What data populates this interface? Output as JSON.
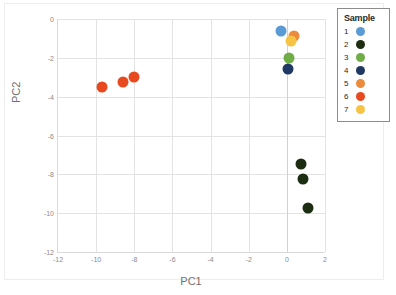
{
  "chart_data": {
    "type": "scatter",
    "title": "",
    "xlabel": "PC1",
    "ylabel": "PC2",
    "xlim": [
      -12,
      2
    ],
    "ylim": [
      -12,
      0
    ],
    "xticks": [
      "-12",
      "-10",
      "-8",
      "-6",
      "-4",
      "-2",
      "0",
      "2"
    ],
    "xtick_values": [
      -12,
      -10,
      -8,
      -6,
      -4,
      -2,
      0,
      2
    ],
    "yticks": [
      "0",
      "-2",
      "-4",
      "-6",
      "-8",
      "-10",
      "-12"
    ],
    "ytick_values": [
      0,
      -2,
      -4,
      -6,
      -8,
      -10,
      -12
    ],
    "grid": true,
    "legend_position": "right",
    "legend_title": "Sample",
    "series": [
      {
        "name": "1",
        "color": "#5b9bd5",
        "points": [
          [
            -0.3,
            -0.6
          ]
        ]
      },
      {
        "name": "2",
        "color": "#1d2d12",
        "points": [
          [
            0.75,
            -7.45
          ],
          [
            0.85,
            -8.25
          ],
          [
            1.1,
            -9.75
          ]
        ]
      },
      {
        "name": "3",
        "color": "#70ad47",
        "points": [
          [
            0.1,
            -2.0
          ]
        ]
      },
      {
        "name": "4",
        "color": "#1f3864",
        "points": [
          [
            0.05,
            -2.6
          ]
        ]
      },
      {
        "name": "5",
        "color": "#ed8b3c",
        "points": [
          [
            0.35,
            -0.85
          ]
        ]
      },
      {
        "name": "6",
        "color": "#e8491f",
        "points": [
          [
            -9.7,
            -3.5
          ],
          [
            -8.6,
            -3.25
          ],
          [
            -8.0,
            -3.0
          ]
        ]
      },
      {
        "name": "7",
        "color": "#f6c344",
        "points": [
          [
            0.2,
            -1.15
          ]
        ]
      }
    ]
  },
  "legend": {
    "title": "Sample",
    "items": [
      {
        "label": "1",
        "color": "#5b9bd5"
      },
      {
        "label": "2",
        "color": "#1d2d12"
      },
      {
        "label": "3",
        "color": "#70ad47"
      },
      {
        "label": "4",
        "color": "#1f3864"
      },
      {
        "label": "5",
        "color": "#ed8b3c"
      },
      {
        "label": "6",
        "color": "#e8491f"
      },
      {
        "label": "7",
        "color": "#f6c344"
      }
    ]
  },
  "axes": {
    "x_title": "PC1",
    "y_title": "PC2"
  }
}
